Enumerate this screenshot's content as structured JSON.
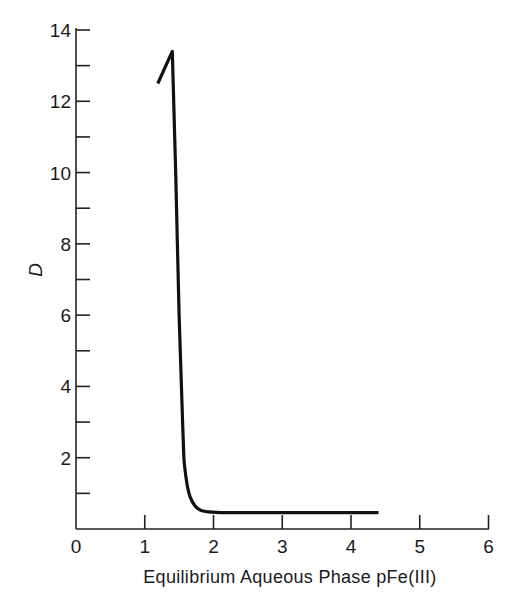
{
  "chart_data": {
    "type": "line",
    "title": "",
    "xlabel": "Equilibrium Aqueous Phase pFe(III)",
    "ylabel": "D",
    "xlim": [
      0,
      6
    ],
    "ylim": [
      0,
      14
    ],
    "x_ticks": [
      0,
      1,
      2,
      3,
      4,
      5,
      6
    ],
    "x_tick_labels": [
      "0",
      "1",
      "2",
      "3",
      "4",
      "5",
      "6"
    ],
    "y_ticks_major": [
      2,
      4,
      6,
      8,
      10,
      12,
      14
    ],
    "y_tick_labels": [
      "2",
      "4",
      "6",
      "8",
      "10",
      "12",
      "14"
    ],
    "y_ticks_minor": [
      1,
      3,
      5,
      7,
      9,
      11,
      13
    ],
    "grid": false,
    "legend": null,
    "series": [
      {
        "name": "D vs pFe(III)",
        "color": "#111111",
        "x": [
          1.19,
          1.4,
          1.45,
          1.5,
          1.55,
          1.57,
          1.59,
          1.62,
          1.66,
          1.73,
          1.82,
          1.98,
          2.2,
          3.0,
          4.0,
          4.4
        ],
        "y": [
          12.5,
          13.4,
          10.0,
          6.0,
          3.0,
          2.0,
          1.6,
          1.2,
          0.9,
          0.65,
          0.52,
          0.47,
          0.46,
          0.46,
          0.46,
          0.46
        ]
      }
    ]
  }
}
